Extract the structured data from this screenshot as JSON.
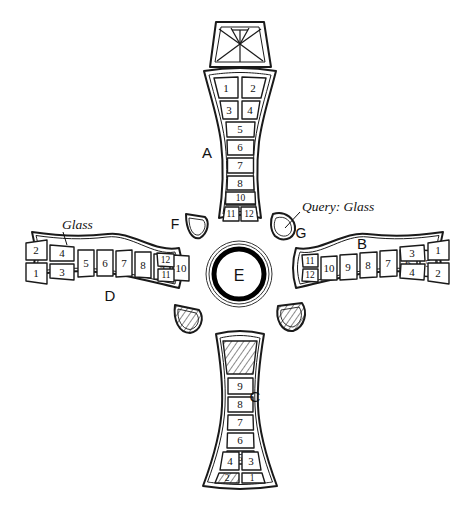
{
  "figure": {
    "background_color": "#ffffff",
    "ink_color": "#1a1a1a"
  },
  "center": {
    "label": "E",
    "name": "center-boss"
  },
  "annotations": [
    {
      "id": "glass-left",
      "text": "Glass",
      "x": 62,
      "y": 224,
      "points_to": "arm-d-cell-4"
    },
    {
      "id": "query-glass",
      "text": "Query: Glass",
      "x": 302,
      "y": 206,
      "points_to": "fragment-g"
    }
  ],
  "arms": [
    {
      "id": "A",
      "label": "A",
      "label_x": 207,
      "label_y": 152,
      "orientation": "top",
      "cells": [
        "1",
        "2",
        "3",
        "4",
        "5",
        "6",
        "7",
        "8",
        "9",
        "10",
        "11",
        "12"
      ],
      "paired_cells": [
        [
          "1",
          "2"
        ],
        [
          "3",
          "4"
        ],
        [
          "11",
          "12"
        ]
      ],
      "single_cells": [
        "5",
        "6",
        "7",
        "8",
        "9",
        "10"
      ],
      "hatched_cells": []
    },
    {
      "id": "B",
      "label": "B",
      "label_x": 362,
      "label_y": 256,
      "orientation": "right",
      "cells": [
        "11",
        "12",
        "10",
        "9",
        "8",
        "7",
        "6",
        "5",
        "3",
        "4",
        "1",
        "2"
      ],
      "paired_cells": [
        [
          "11",
          "12"
        ],
        [
          "3",
          "4"
        ],
        [
          "1",
          "2"
        ]
      ],
      "single_cells": [
        "10",
        "9",
        "8",
        "7",
        "6",
        "5"
      ],
      "hatched_cells": []
    },
    {
      "id": "C",
      "label": "C",
      "label_x": 255,
      "label_y": 396,
      "orientation": "bottom",
      "cells": [
        "",
        "9",
        "8",
        "7",
        "6",
        "5",
        "4",
        "3",
        "2",
        "1"
      ],
      "paired_cells": [
        [
          "4",
          "3"
        ],
        [
          "2",
          "1"
        ]
      ],
      "single_cells": [
        "9",
        "8",
        "7",
        "6",
        "5"
      ],
      "hatched_cells": [
        "top-blank",
        "2"
      ]
    },
    {
      "id": "D",
      "label": "D",
      "label_x": 110,
      "label_y": 295,
      "orientation": "left",
      "cells": [
        "2",
        "1",
        "4",
        "3",
        "5",
        "6",
        "7",
        "8",
        "9",
        "10",
        "12",
        "11"
      ],
      "paired_cells": [
        [
          "2",
          "1"
        ],
        [
          "4",
          "3"
        ],
        [
          "12",
          "11"
        ]
      ],
      "single_cells": [
        "5",
        "6",
        "7",
        "8",
        "9",
        "10"
      ],
      "hatched_cells": []
    }
  ],
  "fragments": [
    {
      "id": "crown",
      "label": "",
      "x": 239,
      "y": 45,
      "hatched": false,
      "rays": true,
      "name": "crown-fragment"
    },
    {
      "id": "F",
      "label": "F",
      "label_x": 175,
      "label_y": 224,
      "x": 196,
      "y": 227,
      "hatched": false,
      "name": "fragment-f"
    },
    {
      "id": "G",
      "label": "G",
      "label_x": 301,
      "label_y": 233,
      "x": 284,
      "y": 224,
      "hatched": false,
      "name": "fragment-g"
    },
    {
      "id": "H",
      "label": "",
      "x": 188,
      "y": 318,
      "hatched": true,
      "name": "fragment-lower-left"
    },
    {
      "id": "I",
      "label": "",
      "x": 290,
      "y": 318,
      "hatched": true,
      "name": "fragment-lower-right"
    }
  ]
}
